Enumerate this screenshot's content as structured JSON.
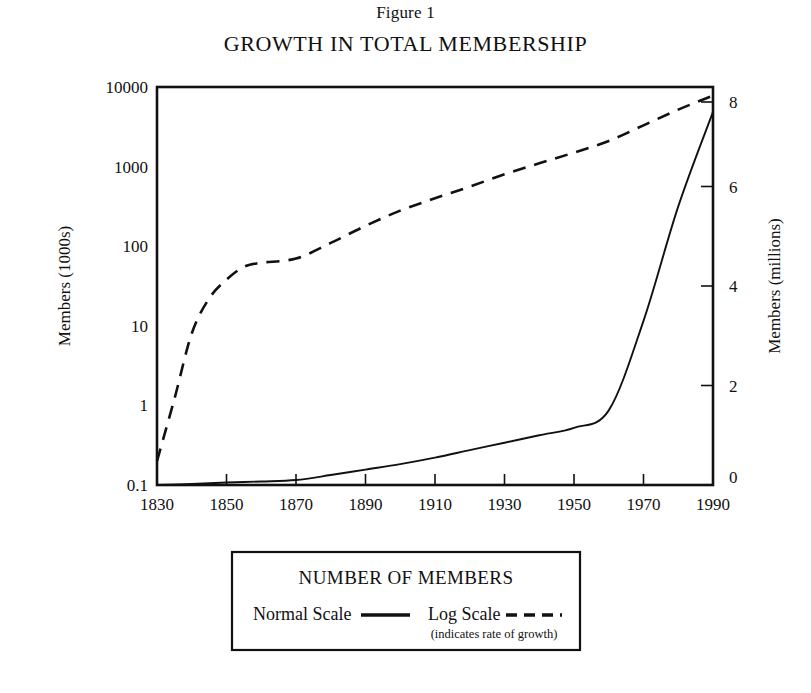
{
  "figure": {
    "number_label": "Figure 1",
    "title": "GROWTH IN TOTAL MEMBERSHIP"
  },
  "legend": {
    "title": "NUMBER OF MEMBERS",
    "normal_label": "Normal Scale",
    "log_label": "Log Scale",
    "note": "(indicates rate of growth)"
  },
  "chart_data": {
    "type": "line",
    "title": "GROWTH IN TOTAL MEMBERSHIP",
    "subtitle": "Figure 1",
    "xlabel": "",
    "ylabel": "Members (1000s)",
    "y2label": "Members (millions)",
    "grid": false,
    "legend_position": "below-plot",
    "xlim": [
      1830,
      1990
    ],
    "xticks": [
      1830,
      1850,
      1870,
      1890,
      1910,
      1930,
      1950,
      1970,
      1990
    ],
    "xtick_labels": [
      "1830",
      "1850",
      "1870",
      "1890",
      "1910",
      "1930",
      "1950",
      "1970",
      "1990"
    ],
    "yscale": "log",
    "ylim": [
      0.1,
      10000
    ],
    "yticks": [
      0.1,
      1,
      10,
      100,
      1000,
      10000
    ],
    "ytick_labels": [
      "0.1",
      "1",
      "10",
      "100",
      "1000",
      "10000"
    ],
    "y2scale": "linear",
    "y2lim": [
      0,
      8
    ],
    "y2ticks": [
      0,
      2,
      4,
      6,
      8
    ],
    "y2tick_labels": [
      "0",
      "2",
      "4",
      "6",
      "8"
    ],
    "series": [
      {
        "name": "Normal Scale",
        "style": "solid",
        "axis": "right",
        "units": "millions of members",
        "x": [
          1830,
          1840,
          1850,
          1860,
          1870,
          1880,
          1890,
          1900,
          1910,
          1920,
          1930,
          1940,
          1950,
          1960,
          1970,
          1980,
          1990
        ],
        "values": [
          0.0002,
          0.02,
          0.05,
          0.07,
          0.1,
          0.2,
          0.31,
          0.42,
          0.55,
          0.7,
          0.85,
          1.0,
          1.15,
          1.5,
          3.3,
          5.6,
          7.5
        ]
      },
      {
        "name": "Log Scale",
        "style": "dashed",
        "axis": "left",
        "units": "thousands of members",
        "x": [
          1830,
          1835,
          1840,
          1845,
          1850,
          1855,
          1860,
          1870,
          1880,
          1890,
          1900,
          1910,
          1920,
          1930,
          1940,
          1950,
          1960,
          1970,
          1980,
          1990
        ],
        "values": [
          0.2,
          1.2,
          8,
          22,
          38,
          55,
          62,
          70,
          110,
          180,
          280,
          400,
          560,
          800,
          1100,
          1500,
          2100,
          3300,
          5200,
          7800
        ]
      }
    ]
  }
}
